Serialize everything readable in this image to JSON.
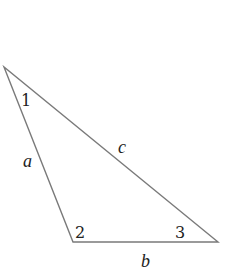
{
  "diagram": {
    "type": "triangle",
    "stroke_color": "#7a7a7a",
    "vertices": [
      {
        "id": "A",
        "x": 4,
        "y": 67
      },
      {
        "id": "B",
        "x": 73,
        "y": 242
      },
      {
        "id": "C",
        "x": 218,
        "y": 242
      }
    ],
    "angle_labels": [
      {
        "text": "1",
        "x": 21,
        "y": 106
      },
      {
        "text": "2",
        "x": 75,
        "y": 238
      },
      {
        "text": "3",
        "x": 175,
        "y": 238
      }
    ],
    "side_labels": [
      {
        "text": "a",
        "x": 23,
        "y": 167
      },
      {
        "text": "c",
        "x": 118,
        "y": 153
      },
      {
        "text": "b",
        "x": 141,
        "y": 267
      }
    ]
  }
}
